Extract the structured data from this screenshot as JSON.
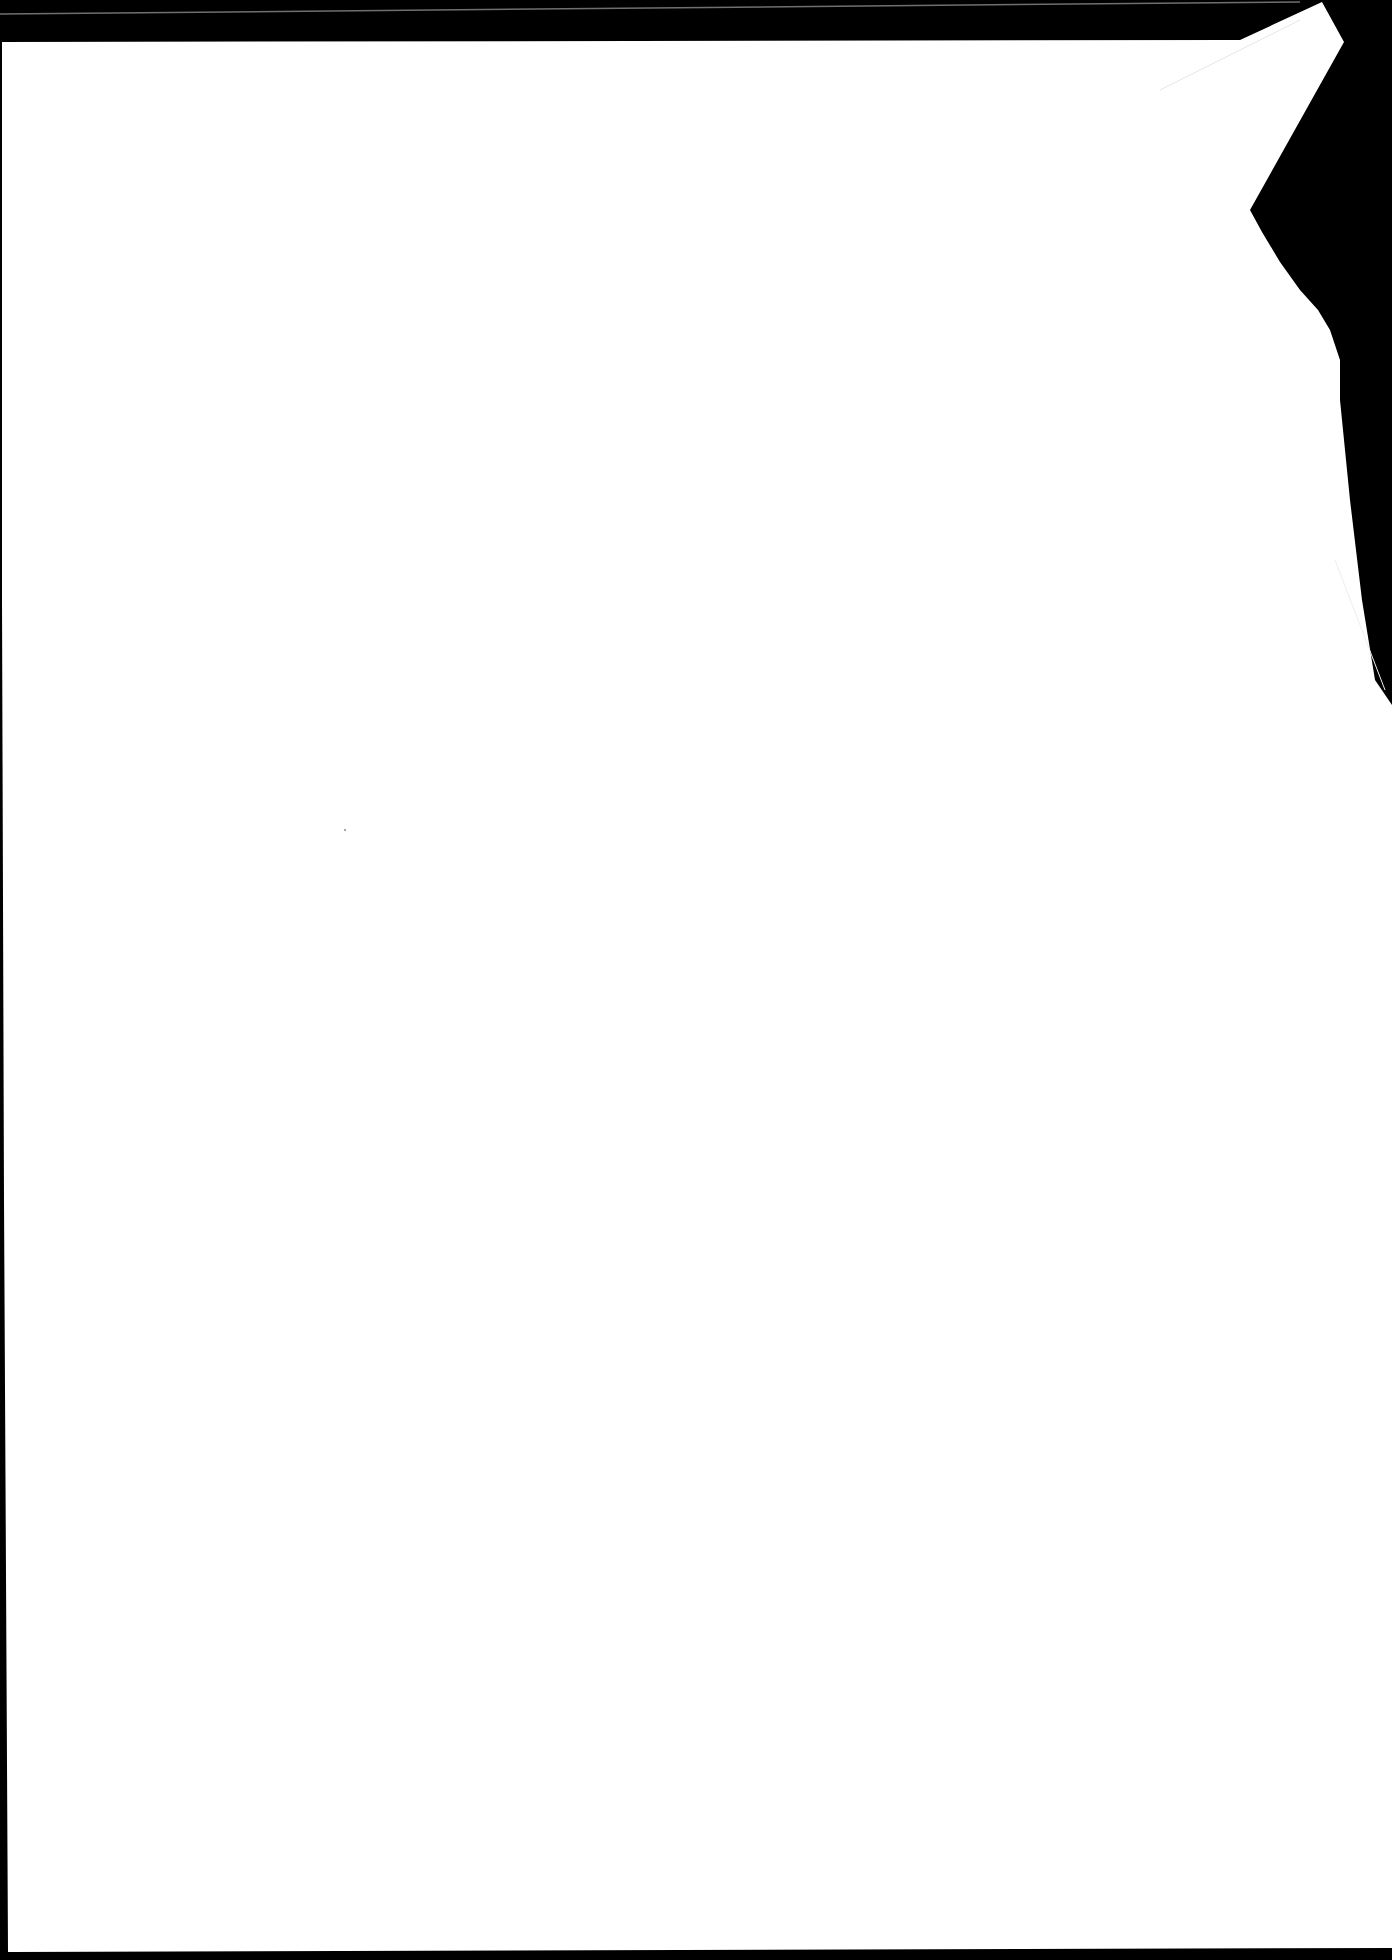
{
  "document": {
    "type": "scanned-page",
    "content": "",
    "colors": {
      "paper": "#ffffff",
      "background": "#000000",
      "edge_line": "#6f6f6f"
    }
  }
}
